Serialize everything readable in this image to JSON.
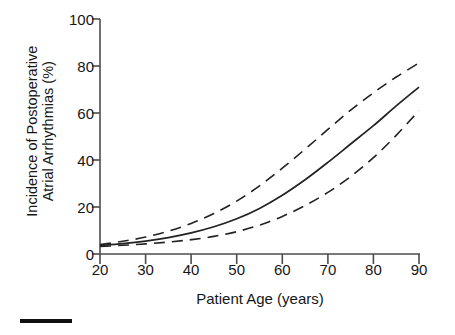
{
  "chart_data": {
    "type": "line",
    "title": "",
    "xlabel": "Patient Age (years)",
    "ylabel": "Incidence of Postoperative Atrial Arrhythmias (%)",
    "ylabel_line1": "Incidence of Postoperative",
    "ylabel_line2": "Atrial Arrhythmias (%)",
    "xlim": [
      20,
      90
    ],
    "ylim": [
      0,
      100
    ],
    "xticks": [
      20,
      30,
      40,
      50,
      60,
      70,
      80,
      90
    ],
    "yticks": [
      0,
      20,
      40,
      60,
      80,
      100
    ],
    "xtick_labels": [
      "20",
      "30",
      "40",
      "50",
      "60",
      "70",
      "80",
      "90"
    ],
    "ytick_labels": [
      "0",
      "20",
      "40",
      "60",
      "80",
      "100"
    ],
    "grid": false,
    "legend": "none",
    "x": [
      20,
      25,
      30,
      35,
      40,
      45,
      50,
      55,
      60,
      65,
      70,
      75,
      80,
      85,
      90
    ],
    "series": [
      {
        "name": "Upper 95% confidence limit",
        "style": "dashed",
        "color": "#222222",
        "values": [
          4.0,
          5.4,
          7.2,
          9.7,
          13.0,
          17.2,
          22.5,
          29.0,
          36.5,
          44.6,
          53.0,
          61.2,
          68.6,
          75.3,
          81.3
        ]
      },
      {
        "name": "Predicted incidence",
        "style": "solid",
        "color": "#222222",
        "values": [
          3.6,
          4.4,
          5.5,
          7.0,
          9.0,
          11.6,
          15.0,
          19.4,
          25.0,
          31.6,
          39.0,
          46.8,
          54.6,
          63.0,
          71.0
        ]
      },
      {
        "name": "Lower 95% confidence limit",
        "style": "dashed",
        "color": "#222222",
        "values": [
          3.2,
          3.7,
          4.3,
          5.1,
          6.1,
          7.5,
          9.5,
          12.3,
          16.0,
          20.6,
          26.2,
          33.0,
          41.0,
          50.5,
          61.0
        ]
      }
    ],
    "axis_color": "#4d4d4d",
    "scalebar_color": "#111111"
  }
}
